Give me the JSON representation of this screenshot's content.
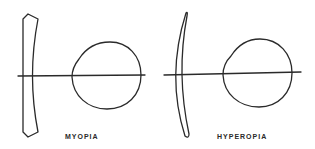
{
  "figure": {
    "panels": [
      {
        "id": "myopia",
        "label": "MYOPIA",
        "lens_type": "concave-lens",
        "elements": [
          "concave-lens",
          "optical-axis",
          "eyeball"
        ]
      },
      {
        "id": "hyperopia",
        "label": "HYPEROPIA",
        "lens_type": "convex-meniscus-lens",
        "elements": [
          "convex-lens",
          "optical-axis",
          "eyeball"
        ]
      }
    ],
    "colors": {
      "stroke": "#2a2a2a",
      "background": "#ffffff"
    }
  }
}
